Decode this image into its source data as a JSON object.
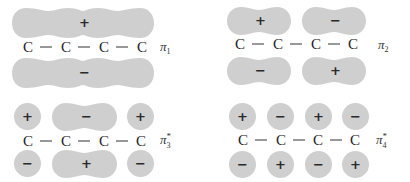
{
  "figure": {
    "colors": {
      "lobe": "#cfcfcf",
      "text": "#1e1e1e",
      "background": "#ffffff"
    },
    "orbitals": [
      {
        "id": "pi1",
        "label": "π",
        "subscript": "1",
        "superscript": "",
        "atoms": [
          "C",
          "C",
          "C",
          "C"
        ],
        "top_lobes": [
          {
            "span": "C1-C4",
            "sign": "+"
          }
        ],
        "bottom_lobes": [
          {
            "span": "C1-C4",
            "sign": "−"
          }
        ]
      },
      {
        "id": "pi2",
        "label": "π",
        "subscript": "2",
        "superscript": "",
        "atoms": [
          "C",
          "C",
          "C",
          "C"
        ],
        "top_lobes": [
          {
            "span": "C1-C2",
            "sign": "+"
          },
          {
            "span": "C3-C4",
            "sign": "−"
          }
        ],
        "bottom_lobes": [
          {
            "span": "C1-C2",
            "sign": "−"
          },
          {
            "span": "C3-C4",
            "sign": "+"
          }
        ]
      },
      {
        "id": "pi3star",
        "label": "π",
        "subscript": "3",
        "superscript": "*",
        "atoms": [
          "C",
          "C",
          "C",
          "C"
        ],
        "top_lobes": [
          {
            "span": "C1",
            "sign": "+"
          },
          {
            "span": "C2-C3",
            "sign": "−"
          },
          {
            "span": "C4",
            "sign": "+"
          }
        ],
        "bottom_lobes": [
          {
            "span": "C1",
            "sign": "−"
          },
          {
            "span": "C2-C3",
            "sign": "+"
          },
          {
            "span": "C4",
            "sign": "−"
          }
        ]
      },
      {
        "id": "pi4star",
        "label": "π",
        "subscript": "4",
        "superscript": "*",
        "atoms": [
          "C",
          "C",
          "C",
          "C"
        ],
        "top_lobes": [
          {
            "span": "C1",
            "sign": "+"
          },
          {
            "span": "C2",
            "sign": "−"
          },
          {
            "span": "C3",
            "sign": "+"
          },
          {
            "span": "C4",
            "sign": "−"
          }
        ],
        "bottom_lobes": [
          {
            "span": "C1",
            "sign": "−"
          },
          {
            "span": "C2",
            "sign": "+"
          },
          {
            "span": "C3",
            "sign": "−"
          },
          {
            "span": "C4",
            "sign": "+"
          }
        ]
      }
    ]
  }
}
